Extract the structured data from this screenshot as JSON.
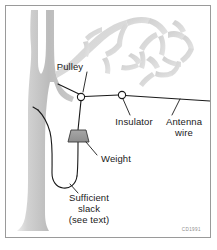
{
  "figure": {
    "credit": "CD1991",
    "frame_color": "#9a9a9a",
    "background_color": "#ffffff",
    "line_color": "#1a1a1a",
    "tree_color": "#bdbdbd",
    "branch_color": "#d8d8d8",
    "weight_color": "#9a9a9a"
  },
  "labels": {
    "pulley": "Pulley",
    "insulator": "Insulator",
    "antenna_wire_line1": "Antenna",
    "antenna_wire_line2": "wire",
    "weight": "Weight",
    "slack_line1": "Sufficient",
    "slack_line2": "slack",
    "slack_line3": "(see text)"
  },
  "components": {
    "pulley": {
      "shape": "circle",
      "cx": 81,
      "cy": 97,
      "r": 3.6
    },
    "insulator": {
      "shape": "circle",
      "cx": 122,
      "cy": 95,
      "r": 3.6
    },
    "weight": {
      "shape": "trapezoid",
      "x": 68,
      "y": 130,
      "width": 20,
      "height": 12
    },
    "tree": {
      "shape": "trunk-with-branches",
      "side": "left"
    },
    "antenna_wire": {
      "from_x": 122,
      "from_y": 95,
      "to_x": 210,
      "to_y": 101
    },
    "rope": {
      "anchor_x": 38,
      "anchor_y": 110,
      "loop_bottom_y": 183
    }
  }
}
